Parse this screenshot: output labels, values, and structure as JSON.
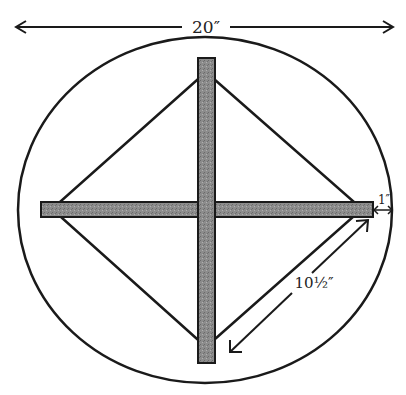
{
  "diagram": {
    "dimensions": {
      "overall_width": "20″",
      "diagonal_length": "10½″",
      "overhang": "1″"
    },
    "colors": {
      "ink": "#1a1a1a",
      "stick_fill": "#8a8a8a",
      "background": "#ffffff"
    },
    "parts": [
      "outer-circle",
      "vertical-stick",
      "horizontal-stick",
      "diamond-string"
    ]
  }
}
